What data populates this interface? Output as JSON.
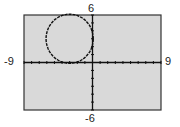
{
  "window": {
    "xmin": "-9",
    "xmax": "9",
    "ymin": "-6",
    "ymax": "6"
  },
  "colors": {
    "screen_bg": "#d9d9d9",
    "frame": "#333333",
    "axis": "#111111",
    "curve": "#111111"
  },
  "chart_data": {
    "type": "line",
    "title": "",
    "xlabel": "",
    "ylabel": "",
    "xlim": [
      -9,
      9
    ],
    "ylim": [
      -6,
      6
    ],
    "grid": false,
    "legend": null,
    "tick_labels": {
      "x": [
        "-9",
        "9"
      ],
      "y": [
        "-6",
        "6"
      ]
    },
    "xscale_ticks": 1,
    "yscale_ticks": 1,
    "series": [
      {
        "name": "circle",
        "shape": "circle",
        "center": [
          -3,
          3
        ],
        "radius": 3.1,
        "description": "Circle in quadrant II crossing the x-axis near x=-4.5 and x=-1.7 and the y-axis near y=1.8 and y=3.7"
      }
    ]
  }
}
